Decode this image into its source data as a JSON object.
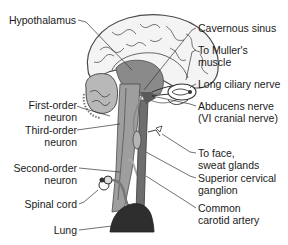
{
  "colors": {
    "background": "#ffffff",
    "text": "#1a1a1a",
    "brain_fill": "#f4f4f4",
    "brain_outline": "#4a4a4a",
    "deep_structure": "#8a8a8a",
    "brainstem": "#9a9a9a",
    "artery": "#6e6e6e",
    "lung": "#2e2e2e",
    "leader_line": "#333333"
  },
  "labels_left": [
    {
      "id": "hypothalamus",
      "lines": [
        "Hypothalamus"
      ]
    },
    {
      "id": "first-order-neuron",
      "lines": [
        "First-order",
        "neuron"
      ]
    },
    {
      "id": "third-order-neuron",
      "lines": [
        "Third-order",
        "neuron"
      ]
    },
    {
      "id": "second-order-neuron",
      "lines": [
        "Second-order",
        "neuron"
      ]
    },
    {
      "id": "spinal-cord",
      "lines": [
        "Spinal cord"
      ]
    },
    {
      "id": "lung",
      "lines": [
        "Lung"
      ]
    }
  ],
  "labels_right": [
    {
      "id": "cavernous-sinus",
      "lines": [
        "Cavernous sinus"
      ]
    },
    {
      "id": "to-mullers-muscle",
      "lines": [
        "To Muller's",
        "muscle"
      ]
    },
    {
      "id": "long-ciliary-nerve",
      "lines": [
        "Long ciliary nerve"
      ]
    },
    {
      "id": "abducens-nerve",
      "lines": [
        "Abducens nerve",
        "(VI cranial nerve)"
      ]
    },
    {
      "id": "to-face-sweat-glands",
      "lines": [
        "To face,",
        "sweat glands"
      ]
    },
    {
      "id": "superior-cervical-ganglion",
      "lines": [
        "Superior cervical",
        "ganglion"
      ]
    },
    {
      "id": "common-carotid-artery",
      "lines": [
        "Common",
        "carotid artery"
      ]
    }
  ]
}
